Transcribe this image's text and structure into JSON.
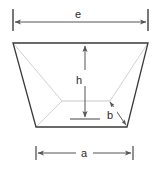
{
  "figure": {
    "kind": "technical-line-drawing",
    "background_color": "#ffffff",
    "outline_color": "#3a3a3a",
    "inner_line_color": "#cfcfcf",
    "dimension_line_color": "#555555",
    "label_color": "#2a2a2a",
    "labels": {
      "top_width": "e",
      "height": "h",
      "bottom_width": "a",
      "slant": "b"
    },
    "dimensions": [
      {
        "name": "e",
        "label": "e",
        "orientation": "horizontal",
        "position": "top",
        "arrowheads": "both"
      },
      {
        "name": "h",
        "label": "h",
        "orientation": "vertical",
        "position": "center",
        "arrowheads": "both"
      },
      {
        "name": "b",
        "label": "b",
        "orientation": "diagonal",
        "position": "bottom-right",
        "arrowheads": "both"
      },
      {
        "name": "a",
        "label": "a",
        "orientation": "horizontal",
        "position": "bottom",
        "arrowheads": "both"
      }
    ],
    "geometry": {
      "outer_top_left": [
        13,
        43
      ],
      "outer_top_right": [
        148,
        43
      ],
      "outer_bottom_right": [
        127,
        127
      ],
      "outer_bottom_left": [
        36,
        127
      ],
      "inner_left": [
        62,
        101
      ],
      "inner_right": [
        110,
        101
      ]
    }
  }
}
